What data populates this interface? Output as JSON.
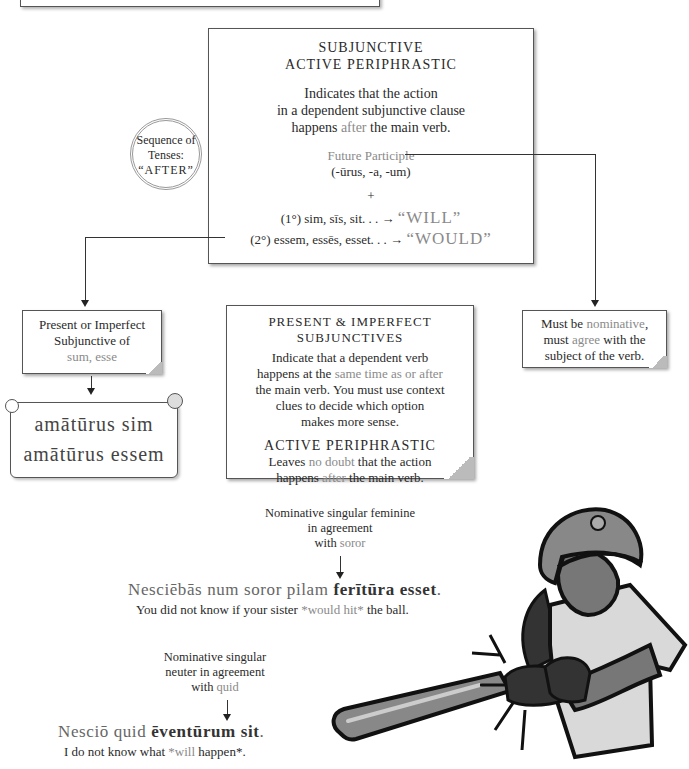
{
  "main_box": {
    "title_line1": "SUBJUNCTIVE",
    "title_line2": "ACTIVE PERIPHRASTIC",
    "desc_line1": "Indicates that the action",
    "desc_line2": "in a dependent subjunctive clause",
    "desc_pre": "happens ",
    "desc_highlight": "after",
    "desc_post": " the main verb.",
    "participle_label": "Future Participle",
    "participle_endings": "(-ūrus, -a, -um)",
    "plus": "+",
    "form1_prefix": "(1°) sim, sīs, sit. . . → ",
    "form1_meaning": "“WILL”",
    "form2_prefix": "(2°) essem, essēs, esset. . . → ",
    "form2_meaning": "“WOULD”"
  },
  "sequence_circle": {
    "line1": "Sequence of",
    "line2": "Tenses:",
    "line3": "“AFTER”"
  },
  "left_box": {
    "line1": "Present or Imperfect",
    "line2": "Subjunctive of",
    "line3": "sum, esse"
  },
  "scroll": {
    "line1": "amātūrus sim",
    "line2": "amātūrus essem"
  },
  "middle_box": {
    "title_line1": "PRESENT & IMPERFECT",
    "title_line2": "SUBJUNCTIVES",
    "line1": "Indicate that a dependent verb",
    "line2_pre": "happens at the ",
    "line2_highlight": "same time as or after",
    "line3": "the main verb.  You must use context",
    "line4": "clues to decide which option",
    "line5": "makes more sense.",
    "sub_title": "ACTIVE PERIPHRASTIC",
    "sub_line1_pre": "Leaves ",
    "sub_line1_highlight": "no doubt",
    "sub_line1_post": " that the action",
    "sub_line2_pre": "happens ",
    "sub_line2_highlight": "after",
    "sub_line2_post": " the main verb."
  },
  "right_box": {
    "line1_pre": "Must be ",
    "line1_highlight": "nominative",
    "line1_post": ",",
    "line2_pre": "must ",
    "line2_highlight": "agree",
    "line2_post": " with the",
    "line3": "subject of the verb."
  },
  "example1": {
    "note_line1": "Nominative singular feminine",
    "note_line2": "in agreement",
    "note_line3_pre": "with ",
    "note_line3_highlight": "soror",
    "latin_pre": "Nesciēbās num soror pilam ",
    "latin_bold": "ferītūra esset",
    "latin_post": ".",
    "english_pre": "You did not know if your sister ",
    "english_highlight": "*would hit*",
    "english_post": " the ball."
  },
  "example2": {
    "note_line1": "Nominative singular",
    "note_line2": "neuter in agreement",
    "note_line3_pre": "with ",
    "note_line3_highlight": "quid",
    "latin_pre": "Nesciō quid ",
    "latin_bold": "ēventūrum sit",
    "latin_post": ".",
    "english_pre": "I do not know what ",
    "english_highlight": "*will",
    "english_post": " happen*."
  },
  "illustration": {
    "subject": "softball-batter-illustration"
  },
  "colors": {
    "text": "#2a2a2a",
    "highlight": "#8a8a8a",
    "border": "#555555"
  }
}
